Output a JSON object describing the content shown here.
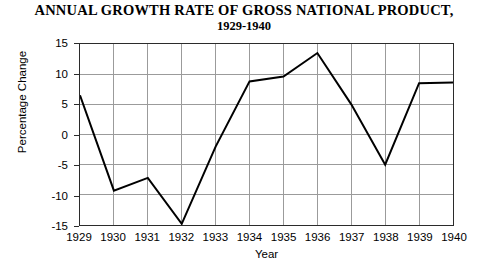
{
  "chart_data": {
    "type": "line",
    "title": "ANNUAL GROWTH RATE OF GROSS NATIONAL PRODUCT,",
    "subtitle": "1929-1940",
    "xlabel": "Year",
    "ylabel": "Percentage Change",
    "categories": [
      "1929",
      "1930",
      "1931",
      "1932",
      "1933",
      "1934",
      "1935",
      "1936",
      "1937",
      "1938",
      "1939",
      "1940"
    ],
    "values": [
      6.5,
      -9.3,
      -7.2,
      -14.8,
      -2.0,
      8.8,
      9.6,
      13.5,
      5.0,
      -5.0,
      8.5,
      8.6
    ],
    "ylim": [
      -15,
      15
    ],
    "yticks": [
      "15",
      "10",
      "5",
      "0",
      "-5",
      "-10",
      "-15"
    ],
    "ytick_values": [
      15,
      10,
      5,
      0,
      -5,
      -10,
      -15
    ],
    "grid": true,
    "legend": "none",
    "line_color": "#000000",
    "grid_color": "#9a9a9a",
    "frame_color": "#2b2b2b",
    "background": "#ffffff"
  }
}
